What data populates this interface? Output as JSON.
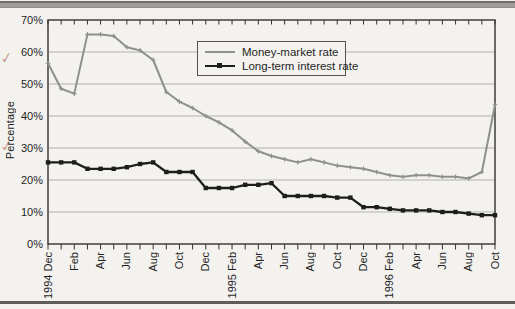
{
  "page": {
    "background_color": "#f3f2ef"
  },
  "decorations": {
    "top_rule": true,
    "bottom_rule": true,
    "margin_marks": [
      "✓",
      "✓"
    ]
  },
  "chart_data": {
    "type": "line",
    "title": "",
    "xlabel": "",
    "ylabel": "Percentage",
    "ylim": [
      0,
      70
    ],
    "ytick_step": 10,
    "ytick_labels": [
      "0%",
      "10%",
      "20%",
      "30%",
      "40%",
      "50%",
      "60%",
      "70%"
    ],
    "grid": "horizontal",
    "legend_position": "top-center",
    "x_axis": {
      "tick_count": 35,
      "tick_unit": "month",
      "labels_every_2_ticks": [
        "1994 Dec",
        "Feb",
        "Apr",
        "Jun",
        "Aug",
        "Oct",
        "Dec",
        "1995 Feb",
        "Apr",
        "Jun",
        "Aug",
        "Oct",
        "Dec",
        "1996 Feb",
        "Apr",
        "Jun",
        "Aug",
        "Oct"
      ]
    },
    "series": [
      {
        "name": "Money-market rate",
        "color": "#8f8f8f",
        "marker": "plus",
        "values": [
          56.5,
          48.5,
          47,
          65.5,
          65.5,
          65,
          61.5,
          60.5,
          57.5,
          47.5,
          44.5,
          42.5,
          40,
          38,
          35.5,
          32,
          29,
          27.5,
          26.5,
          25.5,
          26.5,
          25.5,
          24.5,
          24,
          23.5,
          22.5,
          21.5,
          21,
          21.5,
          21.5,
          21,
          21,
          20.5,
          22.5,
          43.5
        ]
      },
      {
        "name": "Long-term interest rate",
        "color": "#1d1d1d",
        "marker": "square",
        "values": [
          25.5,
          25.5,
          25.5,
          23.5,
          23.5,
          23.5,
          24,
          25,
          25.5,
          22.5,
          22.5,
          22.5,
          17.5,
          17.5,
          17.5,
          18.5,
          18.5,
          19,
          15,
          15,
          15,
          15,
          14.5,
          14.5,
          11.5,
          11.5,
          11,
          10.5,
          10.5,
          10.5,
          10,
          10,
          9.5,
          9,
          9
        ]
      }
    ]
  }
}
